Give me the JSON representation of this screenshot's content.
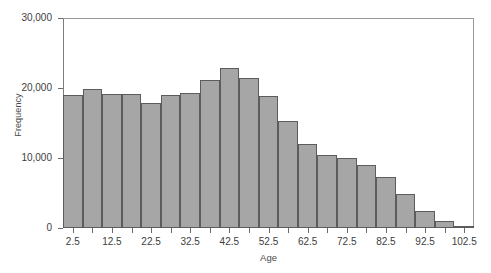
{
  "chart_data": {
    "type": "bar",
    "title": "",
    "subtitle": "",
    "xlabel": "Age",
    "ylabel": "Frequency",
    "xlim": [
      0,
      105
    ],
    "ylim": [
      0,
      30000
    ],
    "grid": false,
    "legend": null,
    "bin_width": 5,
    "categories": [
      "0-5",
      "5-10",
      "10-15",
      "15-20",
      "20-25",
      "25-30",
      "30-35",
      "35-40",
      "40-45",
      "45-50",
      "50-55",
      "55-60",
      "60-65",
      "65-70",
      "70-75",
      "75-80",
      "80-85",
      "85-90",
      "90-95",
      "95-100",
      "100-105"
    ],
    "bin_centers": [
      2.5,
      7.5,
      12.5,
      17.5,
      22.5,
      27.5,
      32.5,
      37.5,
      42.5,
      47.5,
      52.5,
      57.5,
      62.5,
      67.5,
      72.5,
      77.5,
      82.5,
      87.5,
      92.5,
      97.5,
      102.5
    ],
    "values": [
      19000,
      19800,
      19200,
      19200,
      17800,
      19000,
      19300,
      21200,
      22800,
      21500,
      18800,
      15300,
      12000,
      10400,
      10000,
      9000,
      7300,
      4900,
      2400,
      1000,
      200
    ],
    "x_tick_labels": [
      "2.5",
      "12.5",
      "22.5",
      "32.5",
      "42.5",
      "52.5",
      "62.5",
      "72.5",
      "82.5",
      "92.5",
      "102.5"
    ],
    "x_tick_values": [
      2.5,
      12.5,
      22.5,
      32.5,
      42.5,
      52.5,
      62.5,
      72.5,
      82.5,
      92.5,
      102.5
    ],
    "y_tick_labels": [
      "0",
      "10,000",
      "20,000",
      "30,000"
    ],
    "y_tick_values": [
      0,
      10000,
      20000,
      30000
    ],
    "bar_fill_color": "#a6a6a6",
    "bar_edge_color": "#5c5c5c",
    "axis_color": "#7d7d7d",
    "text_color": "#3d3d3d",
    "background_color": "#ffffff"
  }
}
